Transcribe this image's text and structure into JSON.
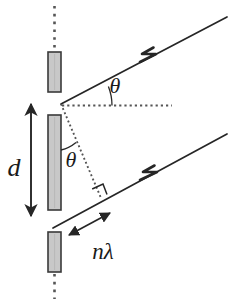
{
  "figure": {
    "background_color": "#ffffff",
    "width": 231,
    "height": 303
  },
  "colors": {
    "line": "#262626",
    "slit_fill": "#c8c8c8",
    "slit_stroke": "#3a3a3a",
    "dotted": "#555555",
    "label": "#1a1a1a"
  },
  "labels": {
    "slit_separation": "d",
    "angle_upper": "θ",
    "angle_lower": "θ",
    "path_difference": "nλ"
  },
  "elements": {
    "slit_top": "slit-barrier-top",
    "slit_middle": "slit-barrier-middle",
    "slit_bottom": "slit-barrier-bottom",
    "ray_upper": "outgoing-ray-upper",
    "ray_lower": "outgoing-ray-lower",
    "reference_axis": "dotted-horizontal-reference",
    "grating_axis": "dotted-vertical-grating-axis",
    "path_diff_leg": "dotted-path-difference-leg",
    "right_angle": "right-angle-marker",
    "separation_arrow": "slit-separation-arrow",
    "path_diff_arrow": "path-difference-arrow"
  },
  "geometry": {
    "slit_x": 48,
    "slit_width": 13,
    "vertex_upper": [
      61,
      104
    ],
    "vertex_lower": [
      61,
      210
    ],
    "foot_perpendicular": [
      101,
      198
    ],
    "ray_angle_deg": 22
  }
}
